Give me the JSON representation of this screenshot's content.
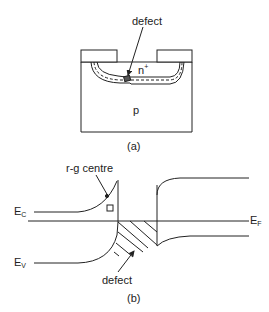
{
  "figure_a": {
    "defect_label": "defect",
    "n_region_label": "n",
    "n_region_sup": "+",
    "p_region_label": "p",
    "caption": "(a)"
  },
  "figure_b": {
    "rg_centre_label": "r-g centre",
    "ec_label": "E",
    "ec_sub": "C",
    "ev_label": "E",
    "ev_sub": "V",
    "ef_label": "E",
    "ef_sub": "F",
    "defect_label": "defect",
    "caption": "(b)"
  },
  "colors": {
    "line": "#222222",
    "background": "#ffffff"
  }
}
